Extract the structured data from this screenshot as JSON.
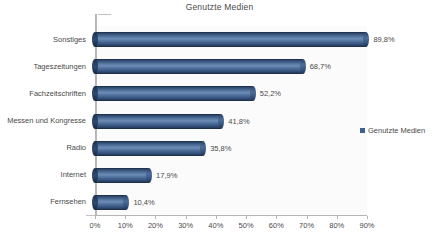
{
  "chart_data": {
    "type": "bar",
    "orientation": "horizontal",
    "title": "Genutzte Medien",
    "xlabel": "",
    "ylabel": "",
    "categories": [
      "Sonstiges",
      "Tageszeitungen",
      "Fachzeitschriften",
      "Messen und Kongresse",
      "Radio",
      "Internet",
      "Fernsehen"
    ],
    "values": [
      89.8,
      68.7,
      52.2,
      41.8,
      35.8,
      17.9,
      10.4
    ],
    "value_labels": [
      "89,8%",
      "68,7%",
      "52,2%",
      "41,8%",
      "35,8%",
      "17,9%",
      "10,4%"
    ],
    "xlim": [
      0,
      90
    ],
    "xticks": [
      0,
      10,
      20,
      30,
      40,
      50,
      60,
      70,
      80,
      90
    ],
    "xtick_labels": [
      "0%",
      "10%",
      "20%",
      "30%",
      "40%",
      "50%",
      "60%",
      "70%",
      "80%",
      "90%"
    ],
    "grid": false,
    "legend": {
      "position": "right",
      "entries": [
        {
          "label": "Genutzte Medien",
          "color": "#3f5f8c"
        }
      ]
    },
    "series": [
      {
        "name": "Genutzte Medien",
        "color": "#3f5f8c",
        "values": [
          89.8,
          68.7,
          52.2,
          41.8,
          35.8,
          17.9,
          10.4
        ]
      }
    ],
    "style": {
      "bar_style": "3d-cylinder",
      "bar_color_dark": "#1d3049",
      "bar_color_light": "#6d8cb4",
      "plot_background": "#fbfbfb",
      "axis_color": "#b5b5b5",
      "text_color": "#4a4a4a"
    }
  }
}
